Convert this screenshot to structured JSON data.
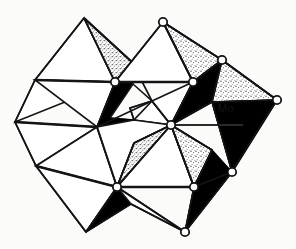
{
  "figure": {
    "type": "crystal-structure-diagram",
    "background_color": "#fbfbfa",
    "line_color": "#141414",
    "dark_face_color": "#000000",
    "stipple_face_color": "#b9b9b9",
    "light_face_color": "#ffffff",
    "vertex_fill_color": "#ffffff",
    "width": 296,
    "height": 249
  },
  "labels": {
    "mo": {
      "text": "Mo",
      "x": 225,
      "y": 112,
      "leader_from_x": 172,
      "leader_from_y": 125,
      "leader_to_x": 243,
      "leader_to_y": 125
    }
  },
  "atoms": {
    "oxygen_label": "O",
    "vertices": [
      {
        "name": "o-top",
        "x": 163,
        "y": 22,
        "r": 4.2
      },
      {
        "name": "o-upper-mid-left",
        "x": 115,
        "y": 82,
        "r": 4.2
      },
      {
        "name": "o-upper-mid-right",
        "x": 193,
        "y": 82,
        "r": 4.2
      },
      {
        "name": "o-upper-right",
        "x": 222,
        "y": 60,
        "r": 4.2
      },
      {
        "name": "o-right",
        "x": 277,
        "y": 100,
        "r": 4.2
      },
      {
        "name": "o-center-mo",
        "x": 171,
        "y": 125,
        "r": 4.2
      },
      {
        "name": "o-lower-right",
        "x": 232,
        "y": 172,
        "r": 4.2
      },
      {
        "name": "o-lower-mid-left",
        "x": 117,
        "y": 187,
        "r": 4.2
      },
      {
        "name": "o-lower-mid-right",
        "x": 194,
        "y": 187,
        "r": 4.2
      },
      {
        "name": "o-bottom",
        "x": 185,
        "y": 232,
        "r": 4.2
      }
    ]
  },
  "polyhedra": {
    "description": "Eight edge- and corner-linked tetrahedra drawn in projection",
    "count": 8,
    "shading_legend": {
      "white": "front faces",
      "stippled": "upper side faces",
      "black": "shadowed under faces"
    }
  }
}
